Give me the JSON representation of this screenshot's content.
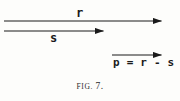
{
  "figure": {
    "caption_prefix": "FIG.",
    "caption_number": "7.",
    "background_color": "#fdfdfb",
    "ink_color": "#1a1a1a"
  },
  "vectors": [
    {
      "id": "vector-r",
      "label": "r",
      "label_position": "above",
      "x_start": 4,
      "x_end": 170,
      "y": 21,
      "arrowhead": "right"
    },
    {
      "id": "vector-s",
      "label": "s",
      "label_position": "below",
      "x_start": 4,
      "x_end": 112,
      "y": 31,
      "arrowhead": "right"
    },
    {
      "id": "vector-p",
      "label": "p = r - s",
      "label_position": "below",
      "x_start": 112,
      "x_end": 170,
      "y": 55,
      "arrowhead": "right"
    }
  ]
}
